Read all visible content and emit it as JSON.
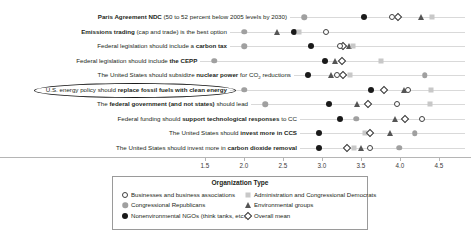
{
  "chart_data": {
    "type": "scatter",
    "title": "",
    "xlabel": "",
    "ylabel": "",
    "xlim": [
      1.35,
      4.78
    ],
    "xticks": [
      1.5,
      2.0,
      2.5,
      3.0,
      3.5,
      4.0,
      4.5
    ],
    "xticklabels": [
      "1.5",
      "2.0",
      "2.5",
      "3.0",
      "3.5",
      "4.0",
      "4.5"
    ],
    "grid": false,
    "legend_position": "bottom-center",
    "series": [
      {
        "name": "Businesses and business associations",
        "marker": "open-circle",
        "color": "#404040"
      },
      {
        "name": "Administration and Congressional Democrats",
        "marker": "square",
        "color": "#c8c8c8"
      },
      {
        "name": "Congressional Republicans",
        "marker": "gray-circle",
        "color": "#a0a0a0"
      },
      {
        "name": "Environmental groups",
        "marker": "triangle",
        "color": "#555555"
      },
      {
        "name": "Nonenvironmental NGOs (think tanks, etc.)",
        "marker": "black-circle",
        "color": "#1a1a1a"
      },
      {
        "name": "Overall mean",
        "marker": "diamond",
        "color": "#333333"
      }
    ],
    "categories": [
      "Paris Agreement NDC (50 to 52 percent below 2005 levels by 2030)",
      "Emissions trading (cap and trade) is the best option",
      "Federal legislation should include a carbon tax",
      "Federal legislation should include the CEPP",
      "The United States should subsidize nuclear power for CO2 reductions",
      "U.S. energy policy should replace fossil fuels with clean energy",
      "The federal government (and not states) should lead",
      "Federal funding should support technological responses to CC",
      "The United States should invest more in CCS",
      "The United States should invest more in carbon dioxide removal"
    ],
    "values": {
      "Businesses and business associations": [
        3.9,
        3.05,
        3.23,
        null,
        3.19,
        4.1,
        3.96,
        4.28,
        null,
        3.62
      ],
      "Administration and Congressional Democrats": [
        4.41,
        2.71,
        3.4,
        3.76,
        3.36,
        4.4,
        4.38,
        null,
        3.55,
        3.41
      ],
      "Congressional Republicans": [
        2.77,
        2.0,
        2.0,
        1.62,
        4.32,
        2.0,
        2.27,
        3.44,
        4.19,
        3.99
      ],
      "Environmental groups": [
        4.27,
        2.42,
        3.35,
        3.17,
        3.12,
        4.05,
        3.45,
        3.94,
        3.87,
        3.5
      ],
      "Nonenvironmental NGOs (think tanks, etc.)": [
        3.54,
        2.64,
        2.86,
        3.04,
        2.82,
        3.63,
        3.09,
        3.23,
        2.96,
        2.96
      ],
      "Overall mean": [
        3.98,
        null,
        3.27,
        3.26,
        3.27,
        3.79,
        3.59,
        4.06,
        3.62,
        3.32
      ]
    },
    "points": [
      [
        {
          "s": "Congressional Republicans",
          "v": 2.77
        },
        {
          "s": "Nonenvironmental NGOs (think tanks, etc.)",
          "v": 3.54
        },
        {
          "s": "Businesses and business associations",
          "v": 3.9
        },
        {
          "s": "Overall mean",
          "v": 3.98
        },
        {
          "s": "Environmental groups",
          "v": 4.27
        },
        {
          "s": "Administration and Congressional Democrats",
          "v": 4.41
        }
      ],
      [
        {
          "s": "Congressional Republicans",
          "v": 2.0
        },
        {
          "s": "Environmental groups",
          "v": 2.42
        },
        {
          "s": "Nonenvironmental NGOs (think tanks, etc.)",
          "v": 2.64
        },
        {
          "s": "Administration and Congressional Democrats",
          "v": 2.71
        },
        {
          "s": "Businesses and business associations",
          "v": 3.05
        }
      ],
      [
        {
          "s": "Congressional Republicans",
          "v": 2.0
        },
        {
          "s": "Nonenvironmental NGOs (think tanks, etc.)",
          "v": 2.86
        },
        {
          "s": "Environmental groups",
          "v": 3.35
        },
        {
          "s": "Overall mean",
          "v": 3.27
        },
        {
          "s": "Businesses and business associations",
          "v": 3.23
        },
        {
          "s": "Administration and Congressional Democrats",
          "v": 3.4
        }
      ],
      [
        {
          "s": "Congressional Republicans",
          "v": 1.62
        },
        {
          "s": "Nonenvironmental NGOs (think tanks, etc.)",
          "v": 3.04
        },
        {
          "s": "Environmental groups",
          "v": 3.17
        },
        {
          "s": "Overall mean",
          "v": 3.26
        },
        {
          "s": "Administration and Congressional Democrats",
          "v": 3.76
        }
      ],
      [
        {
          "s": "Nonenvironmental NGOs (think tanks, etc.)",
          "v": 2.82
        },
        {
          "s": "Environmental groups",
          "v": 3.12
        },
        {
          "s": "Businesses and business associations",
          "v": 3.19
        },
        {
          "s": "Overall mean",
          "v": 3.27
        },
        {
          "s": "Administration and Congressional Democrats",
          "v": 3.36
        },
        {
          "s": "Congressional Republicans",
          "v": 4.32
        }
      ],
      [
        {
          "s": "Congressional Republicans",
          "v": 2.0
        },
        {
          "s": "Nonenvironmental NGOs (think tanks, etc.)",
          "v": 3.63
        },
        {
          "s": "Overall mean",
          "v": 3.79
        },
        {
          "s": "Environmental groups",
          "v": 4.05
        },
        {
          "s": "Businesses and business associations",
          "v": 4.1
        },
        {
          "s": "Administration and Congressional Democrats",
          "v": 4.4
        }
      ],
      [
        {
          "s": "Congressional Republicans",
          "v": 2.27
        },
        {
          "s": "Nonenvironmental NGOs (think tanks, etc.)",
          "v": 3.09
        },
        {
          "s": "Environmental groups",
          "v": 3.45
        },
        {
          "s": "Overall mean",
          "v": 3.59
        },
        {
          "s": "Businesses and business associations",
          "v": 3.96
        },
        {
          "s": "Administration and Congressional Democrats",
          "v": 4.38
        }
      ],
      [
        {
          "s": "Nonenvironmental NGOs (think tanks, etc.)",
          "v": 3.23
        },
        {
          "s": "Congressional Republicans",
          "v": 3.44
        },
        {
          "s": "Overall mean",
          "v": 4.06
        },
        {
          "s": "Environmental groups",
          "v": 3.94
        },
        {
          "s": "Businesses and business associations",
          "v": 4.28
        }
      ],
      [
        {
          "s": "Nonenvironmental NGOs (think tanks, etc.)",
          "v": 2.96
        },
        {
          "s": "Administration and Congressional Democrats",
          "v": 3.55
        },
        {
          "s": "Overall mean",
          "v": 3.62
        },
        {
          "s": "Environmental groups",
          "v": 3.87
        },
        {
          "s": "Congressional Republicans",
          "v": 4.19
        }
      ],
      [
        {
          "s": "Nonenvironmental NGOs (think tanks, etc.)",
          "v": 2.96
        },
        {
          "s": "Overall mean",
          "v": 3.32
        },
        {
          "s": "Administration and Congressional Democrats",
          "v": 3.41
        },
        {
          "s": "Environmental groups",
          "v": 3.5
        },
        {
          "s": "Businesses and business associations",
          "v": 3.62
        },
        {
          "s": "Congressional Republicans",
          "v": 3.99
        }
      ]
    ],
    "highlighted_category": "U.S. energy policy should replace fossil fuels with clean energy"
  },
  "rows": [
    {
      "pre": "",
      "bold": "Paris Agreement NDC",
      "post": " (50 to 52 percent below 2005 levels by 2030)"
    },
    {
      "pre": "",
      "bold": "Emissions trading",
      "post": " (cap and trade) is the best option"
    },
    {
      "pre": "Federal legislation should include a ",
      "bold": "carbon tax",
      "post": ""
    },
    {
      "pre": "Federal legislation should include ",
      "bold": "the CEPP",
      "post": ""
    },
    {
      "pre": "The United States should subsidize ",
      "bold": "nuclear power",
      "post": " for CO",
      "sub": "2",
      "post2": " reductions"
    },
    {
      "pre": "U.S. energy policy should ",
      "bold": "replace fossil fuels with clean energy",
      "post": ""
    },
    {
      "pre": "The ",
      "bold": "federal government (and not states)",
      "post": " should lead"
    },
    {
      "pre": "Federal funding should ",
      "bold": "support technological responses",
      "post": " to CC"
    },
    {
      "pre": "The United States should ",
      "bold": "invest more in CCS",
      "post": ""
    },
    {
      "pre": "The United States should invest more in ",
      "bold": "carbon dioxide removal",
      "post": ""
    }
  ],
  "axis": {
    "ticklabels": [
      "1.5",
      "2.0",
      "2.5",
      "3.0",
      "3.5",
      "4.0",
      "4.5"
    ]
  },
  "legend": {
    "title": "Organization Type",
    "items": [
      {
        "label": "Businesses and business associations",
        "marker": "open-circle"
      },
      {
        "label": "Administration and Congressional Democrats",
        "marker": "square"
      },
      {
        "label": "Congressional Republicans",
        "marker": "gray-circle"
      },
      {
        "label": "Environmental groups",
        "marker": "triangle"
      },
      {
        "label": "Nonenvironmental NGOs (think tanks, etc.)",
        "marker": "black-circle"
      },
      {
        "label": "Overall mean",
        "marker": "diamond"
      }
    ]
  }
}
